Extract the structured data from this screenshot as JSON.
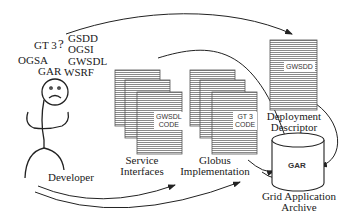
{
  "diagram": {
    "acronyms": [
      "GT 3",
      "GSDD",
      "OGSI",
      "OGSA",
      "GWSDL",
      "GAR",
      "WSRF"
    ],
    "actor": {
      "label": "Developer",
      "question_mark": "?"
    },
    "service_interfaces": {
      "label_line1": "Service",
      "label_line2": "Interfaces",
      "doc_tag_line1": "GWSDL",
      "doc_tag_line2": "CODE"
    },
    "globus_implementation": {
      "label_line1": "Globus",
      "label_line2": "Implementation",
      "doc_tag_line1": "GT 3",
      "doc_tag_line2": "CODE"
    },
    "deployment_descriptor": {
      "label_line1": "Deployment",
      "label_line2": "Descriptor",
      "doc_tag": "GWSDD"
    },
    "archive": {
      "label_line1": "Grid Application",
      "label_line2": "Archive",
      "cylinder_label": "GAR"
    },
    "colors": {
      "ink": "#222222",
      "hatch": "#888888",
      "background": "#ffffff"
    }
  }
}
